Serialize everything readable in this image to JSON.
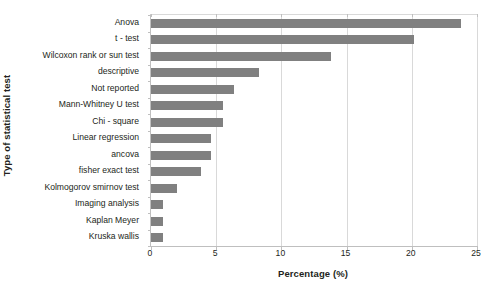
{
  "chart_data": {
    "type": "bar",
    "orientation": "horizontal",
    "title": "",
    "xlabel": "Percentage (%)",
    "ylabel": "Type of statistical test",
    "xlim": [
      0,
      25
    ],
    "xticks": [
      0,
      5,
      10,
      15,
      20,
      25
    ],
    "xtick_labels": [
      "0",
      "5",
      "10",
      "15",
      "20",
      "25"
    ],
    "grid": "vertical",
    "legend": "none",
    "bar_color": "#808080",
    "categories": [
      "Anova",
      "t - test",
      "Wilcoxon rank or sun test",
      "descriptive",
      "Not reported",
      "Mann-Whitney U test",
      "Chi - square",
      "Linear regression",
      "ancova",
      "fisher exact test",
      "Kolmogorov smirnov test",
      "Imaging analysis",
      "Kaplan Meyer",
      "Kruska wallis"
    ],
    "values": [
      23.8,
      20.2,
      13.8,
      8.3,
      6.4,
      5.5,
      5.5,
      4.6,
      4.6,
      3.8,
      2.0,
      0.9,
      0.9,
      0.9
    ]
  },
  "colors": {
    "bar": "#808080",
    "gridline": "#d9d9d9",
    "axis": "#bfbfbf",
    "text": "#231f20",
    "background": "#ffffff"
  }
}
